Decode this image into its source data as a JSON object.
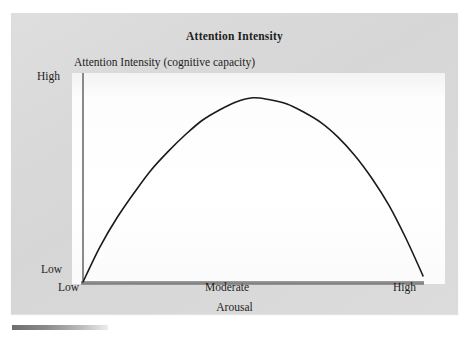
{
  "figure": {
    "title": "Attention Intensity",
    "y_axis_caption": "Attention Intensity (cognitive capacity)",
    "x_axis_title": "Arousal",
    "y_ticks": [
      "High",
      "Low"
    ],
    "x_ticks": [
      "Low",
      "Moderate",
      "High"
    ],
    "colors": {
      "card_background": "#d9d9d9",
      "plot_background": "#ffffff",
      "curve": "#1a1a1a",
      "axis": "#8a8a8a",
      "text": "#1d1d1d"
    }
  },
  "chart_data": {
    "type": "line",
    "title": "Attention Intensity",
    "subtitle": "Attention Intensity (cognitive capacity)",
    "xlabel": "Arousal",
    "ylabel": "Attention Intensity (cognitive capacity)",
    "grid": false,
    "legend": "none",
    "x_tick_labels": [
      "Low",
      "Moderate",
      "High"
    ],
    "y_tick_labels": [
      "Low",
      "High"
    ],
    "xlim": [
      0,
      100
    ],
    "ylim": [
      0,
      100
    ],
    "series": [
      {
        "name": "Attention Intensity",
        "x": [
          0,
          5,
          10,
          15,
          20,
          25,
          30,
          35,
          40,
          45,
          50,
          55,
          60,
          65,
          70,
          75,
          80,
          85,
          90,
          95,
          100
        ],
        "y": [
          0,
          17,
          31,
          43,
          54,
          63,
          71,
          78,
          83,
          87,
          89,
          88,
          86,
          82,
          77,
          70,
          61,
          50,
          37,
          21,
          3
        ]
      }
    ],
    "annotations": [
      {
        "text": "peak at moderate arousal",
        "x": 50,
        "y": 89
      }
    ]
  }
}
